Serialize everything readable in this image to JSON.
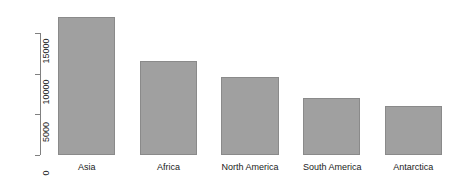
{
  "chart_data": {
    "type": "bar",
    "title": "",
    "subtitle": "",
    "xlabel": "",
    "ylabel": "",
    "categories": [
      "Asia",
      "Africa",
      "North America",
      "South America",
      "Antarctica"
    ],
    "values": [
      17000,
      11600,
      9600,
      7000,
      6000
    ],
    "ylim": [
      0,
      17500
    ],
    "yticks": [
      0,
      5000,
      10000,
      15000
    ],
    "ytick_labels": [
      "0",
      "5000",
      "10000",
      "15000"
    ],
    "grid": false,
    "legend": null,
    "annotations": [],
    "style": {
      "bar_fill": "#a0a0a0",
      "bar_border": "#8a8a8a",
      "axis_color": "#808080",
      "text_color": "#1a1a1a",
      "background": "#ffffff",
      "tick_label_rotation": -90
    }
  }
}
